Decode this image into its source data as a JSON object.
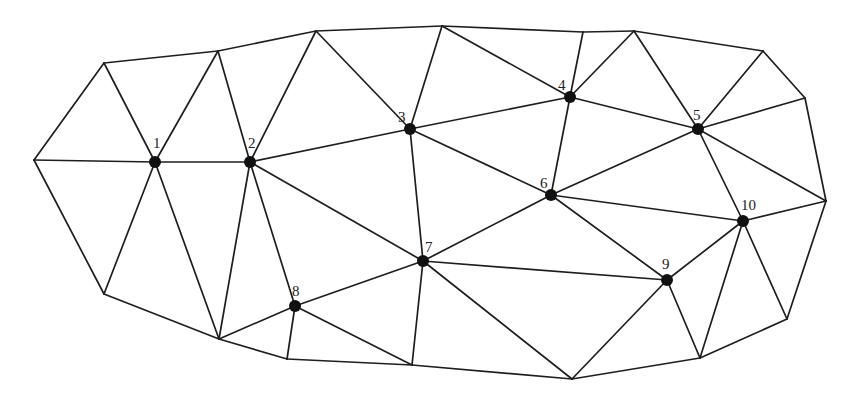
{
  "diagram": {
    "type": "triangulated-mesh",
    "colors": {
      "edge": "#1e1e1e",
      "node": "#111111",
      "label": "#222222",
      "background": "#ffffff"
    },
    "boundary_vertices": [
      {
        "id": "A",
        "x": 34,
        "y": 160
      },
      {
        "id": "B",
        "x": 104,
        "y": 63
      },
      {
        "id": "C",
        "x": 218,
        "y": 51
      },
      {
        "id": "D",
        "x": 316,
        "y": 31
      },
      {
        "id": "E",
        "x": 442,
        "y": 26
      },
      {
        "id": "F",
        "x": 583,
        "y": 32
      },
      {
        "id": "G",
        "x": 634,
        "y": 31
      },
      {
        "id": "H",
        "x": 763,
        "y": 51
      },
      {
        "id": "I",
        "x": 805,
        "y": 98
      },
      {
        "id": "J",
        "x": 826,
        "y": 201
      },
      {
        "id": "K",
        "x": 787,
        "y": 319
      },
      {
        "id": "L",
        "x": 700,
        "y": 358
      },
      {
        "id": "M",
        "x": 572,
        "y": 379
      },
      {
        "id": "N",
        "x": 412,
        "y": 365
      },
      {
        "id": "O",
        "x": 287,
        "y": 359
      },
      {
        "id": "P",
        "x": 219,
        "y": 339
      },
      {
        "id": "Q",
        "x": 104,
        "y": 294
      }
    ],
    "nodes": [
      {
        "id": "1",
        "label": "1",
        "x": 155,
        "y": 162,
        "lx": 153,
        "ly": 143
      },
      {
        "id": "2",
        "label": "2",
        "x": 250,
        "y": 162,
        "lx": 248,
        "ly": 143
      },
      {
        "id": "3",
        "label": "3",
        "x": 410,
        "y": 129,
        "lx": 398,
        "ly": 117
      },
      {
        "id": "4",
        "label": "4",
        "x": 570,
        "y": 97,
        "lx": 558,
        "ly": 85
      },
      {
        "id": "5",
        "label": "5",
        "x": 698,
        "y": 129,
        "lx": 693,
        "ly": 115
      },
      {
        "id": "6",
        "label": "6",
        "x": 551,
        "y": 195,
        "lx": 540,
        "ly": 183
      },
      {
        "id": "7",
        "label": "7",
        "x": 423,
        "y": 261,
        "lx": 425,
        "ly": 247
      },
      {
        "id": "8",
        "label": "8",
        "x": 295,
        "y": 306,
        "lx": 292,
        "ly": 291
      },
      {
        "id": "9",
        "label": "9",
        "x": 667,
        "y": 280,
        "lx": 662,
        "ly": 264
      },
      {
        "id": "10",
        "label": "10",
        "x": 743,
        "y": 221,
        "lx": 741,
        "ly": 205
      }
    ],
    "edges": [
      [
        "A",
        "B"
      ],
      [
        "B",
        "C"
      ],
      [
        "C",
        "D"
      ],
      [
        "D",
        "E"
      ],
      [
        "E",
        "F"
      ],
      [
        "F",
        "G"
      ],
      [
        "G",
        "H"
      ],
      [
        "H",
        "I"
      ],
      [
        "I",
        "J"
      ],
      [
        "J",
        "K"
      ],
      [
        "K",
        "L"
      ],
      [
        "L",
        "M"
      ],
      [
        "M",
        "N"
      ],
      [
        "N",
        "O"
      ],
      [
        "O",
        "P"
      ],
      [
        "P",
        "Q"
      ],
      [
        "Q",
        "A"
      ],
      [
        "A",
        "1"
      ],
      [
        "B",
        "1"
      ],
      [
        "C",
        "1"
      ],
      [
        "1",
        "2"
      ],
      [
        "1",
        "Q"
      ],
      [
        "1",
        "P"
      ],
      [
        "C",
        "2"
      ],
      [
        "D",
        "2"
      ],
      [
        "2",
        "3"
      ],
      [
        "2",
        "7"
      ],
      [
        "2",
        "P"
      ],
      [
        "2",
        "8"
      ],
      [
        "D",
        "3"
      ],
      [
        "E",
        "3"
      ],
      [
        "3",
        "4"
      ],
      [
        "3",
        "6"
      ],
      [
        "3",
        "7"
      ],
      [
        "E",
        "4"
      ],
      [
        "F",
        "4"
      ],
      [
        "G",
        "4"
      ],
      [
        "4",
        "5"
      ],
      [
        "4",
        "6"
      ],
      [
        "G",
        "5"
      ],
      [
        "H",
        "5"
      ],
      [
        "I",
        "5"
      ],
      [
        "J",
        "5"
      ],
      [
        "5",
        "6"
      ],
      [
        "5",
        "10"
      ],
      [
        "6",
        "7"
      ],
      [
        "6",
        "9"
      ],
      [
        "6",
        "10"
      ],
      [
        "7",
        "8"
      ],
      [
        "7",
        "9"
      ],
      [
        "7",
        "N"
      ],
      [
        "7",
        "M"
      ],
      [
        "8",
        "P"
      ],
      [
        "8",
        "O"
      ],
      [
        "8",
        "N"
      ],
      [
        "M",
        "9"
      ],
      [
        "9",
        "L"
      ],
      [
        "9",
        "10"
      ],
      [
        "10",
        "L"
      ],
      [
        "10",
        "K"
      ],
      [
        "10",
        "J"
      ]
    ]
  }
}
